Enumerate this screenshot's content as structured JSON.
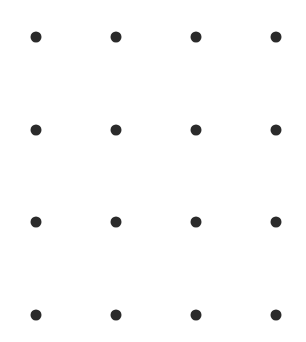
{
  "diagram": {
    "type": "dot-grid",
    "rows": 4,
    "cols": 4,
    "dot_color": "#2b2b2b",
    "background": "#ffffff",
    "dot_diameter_px": 11,
    "col_x": [
      36,
      116,
      196,
      276
    ],
    "row_y": [
      37,
      130,
      222,
      315
    ]
  }
}
